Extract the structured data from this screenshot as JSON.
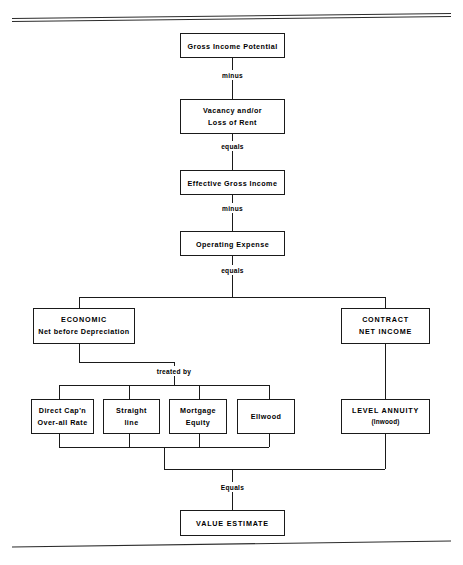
{
  "diagram": {
    "background_color": "#ffffff",
    "line_color": "#1a1a1a",
    "nodes": {
      "gross_income_potential": {
        "line1": "Gross Income Potential"
      },
      "vacancy": {
        "line1": "Vacancy and/or",
        "line2": "Loss of Rent"
      },
      "effective_gross_income": {
        "line1": "Effective Gross Income"
      },
      "operating_expense": {
        "line1": "Operating Expense"
      },
      "economic": {
        "line1": "ECONOMIC",
        "line2": "Net before Depreciation"
      },
      "contract": {
        "line1": "CONTRACT",
        "line2": "NET INCOME"
      },
      "direct_cap": {
        "line1": "Direct Cap'n",
        "line2": "Over-all Rate"
      },
      "straight_line": {
        "line1": "Straight",
        "line2": "line"
      },
      "mortgage_equity": {
        "line1": "Mortgage",
        "line2": "Equity"
      },
      "ellwood": {
        "line1": "Ellwood"
      },
      "level_annuity": {
        "line1": "LEVEL ANNUITY",
        "line2": "(Inwood)"
      },
      "value_estimate": {
        "line1": "VALUE ESTIMATE"
      }
    },
    "edge_labels": {
      "minus_1": "minus",
      "equals_1": "equals",
      "minus_2": "minus",
      "equals_2": "equals",
      "treated_by": "treated by",
      "equals_final": "Equals"
    }
  }
}
